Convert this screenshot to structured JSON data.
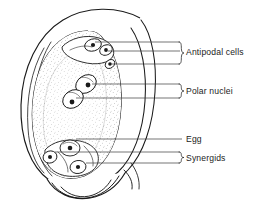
{
  "figure": {
    "background_color": "#ffffff",
    "ink_color": "#1a1a1a",
    "leader_color": "#3a3a3a"
  },
  "labels": [
    {
      "id": "antipodal-cells",
      "text": "Antipodal cells",
      "has_brace": true,
      "leader_count": 3,
      "text_x": 186,
      "text_y": 51
    },
    {
      "id": "polar-nuclei",
      "text": "Polar nuclei",
      "has_brace": true,
      "leader_count": 2,
      "text_x": 186,
      "text_y": 90
    },
    {
      "id": "egg",
      "text": "Egg",
      "has_brace": false,
      "leader_count": 1,
      "text_x": 186,
      "text_y": 142
    },
    {
      "id": "synergids",
      "text": "Synergids",
      "has_brace": true,
      "leader_count": 2,
      "text_x": 186,
      "text_y": 157
    }
  ],
  "structures": {
    "outer_wall": "ovule-outer-wall",
    "integuments": "integument-layers",
    "embryo_sac": "embryo-sac",
    "cytoplasm": "stippled-cytoplasm",
    "micropyle": "micropyle"
  },
  "cells": {
    "antipodal": {
      "count": 3,
      "region": "chalazal-top"
    },
    "polar_nuclei": {
      "count": 2,
      "region": "center"
    },
    "egg": {
      "count": 1,
      "region": "micropylar-bottom"
    },
    "synergids": {
      "count": 2,
      "region": "micropylar-bottom"
    }
  }
}
